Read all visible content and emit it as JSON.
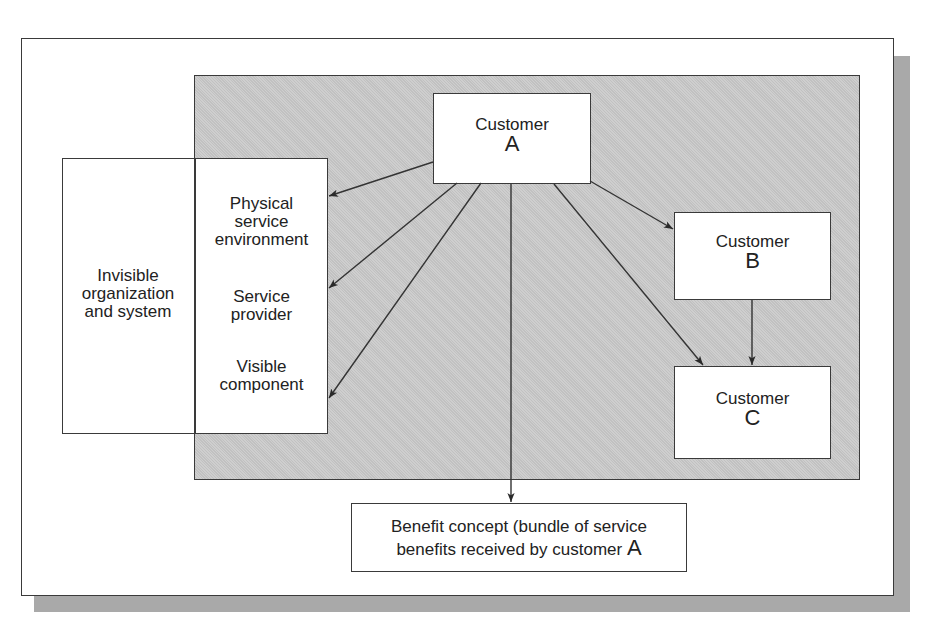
{
  "diagram": {
    "left_group": {
      "invisible_label": [
        "Invisible",
        "organization",
        "and system"
      ],
      "visible_items": [
        {
          "lines": [
            "Physical",
            "service",
            "environment"
          ]
        },
        {
          "lines": [
            "Service",
            "provider"
          ]
        },
        {
          "lines": [
            "Visible",
            "component"
          ]
        }
      ]
    },
    "customers": [
      {
        "id": "A",
        "name": "Customer",
        "letter": "A"
      },
      {
        "id": "B",
        "name": "Customer",
        "letter": "B"
      },
      {
        "id": "C",
        "name": "Customer",
        "letter": "C"
      }
    ],
    "benefit": {
      "line1": "Benefit concept (bundle of service",
      "line2_prefix": "benefits received by customer ",
      "line2_letter": "A"
    },
    "edges": [
      {
        "from": "Customer A",
        "to": "Physical service environment"
      },
      {
        "from": "Customer A",
        "to": "Service provider"
      },
      {
        "from": "Customer A",
        "to": "Visible component"
      },
      {
        "from": "Customer A",
        "to": "Benefit concept"
      },
      {
        "from": "Customer A",
        "to": "Customer B"
      },
      {
        "from": "Customer A",
        "to": "Customer C"
      },
      {
        "from": "Customer B",
        "to": "Customer C"
      }
    ],
    "colors": {
      "panel": "#c9c9c9",
      "shadow": "#a9a9a9",
      "line": "#333333"
    }
  }
}
